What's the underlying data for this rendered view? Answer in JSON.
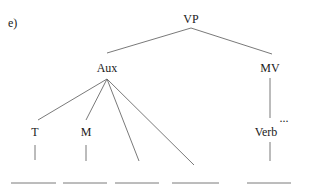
{
  "diagram": {
    "type": "syntax-tree",
    "label": "e)",
    "nodes": [
      {
        "id": "VP",
        "text": "VP",
        "x": 191,
        "y": 23
      },
      {
        "id": "Aux",
        "text": "Aux",
        "x": 107,
        "y": 72
      },
      {
        "id": "MV",
        "text": "MV",
        "x": 270,
        "y": 72
      },
      {
        "id": "T",
        "text": "T",
        "x": 35,
        "y": 136
      },
      {
        "id": "M",
        "text": "M",
        "x": 86,
        "y": 136
      },
      {
        "id": "Verb",
        "text": "Verb",
        "x": 266,
        "y": 136
      }
    ],
    "ellipsis": {
      "text": "...",
      "x": 284,
      "y": 122
    },
    "edges": [
      {
        "from": "VP",
        "to": "Aux",
        "x1": 191,
        "y1": 28,
        "x2": 107,
        "y2": 53
      },
      {
        "from": "VP",
        "to": "MV",
        "x1": 191,
        "y1": 28,
        "x2": 272,
        "y2": 54
      },
      {
        "from": "Aux",
        "to": "T",
        "x1": 107,
        "y1": 79,
        "x2": 38,
        "y2": 120
      },
      {
        "from": "Aux",
        "to": "M",
        "x1": 107,
        "y1": 79,
        "x2": 86,
        "y2": 120
      },
      {
        "from": "Aux",
        "to": "blank-3",
        "x1": 107,
        "y1": 79,
        "x2": 139,
        "y2": 161
      },
      {
        "from": "Aux",
        "to": "blank-4",
        "x1": 107,
        "y1": 79,
        "x2": 194,
        "y2": 165
      },
      {
        "from": "MV",
        "to": "Verb",
        "x1": 270,
        "y1": 78,
        "x2": 270,
        "y2": 118
      },
      {
        "from": "T",
        "to": "blank-1",
        "x1": 35,
        "y1": 145,
        "x2": 35,
        "y2": 160
      },
      {
        "from": "M",
        "to": "blank-2",
        "x1": 86,
        "y1": 145,
        "x2": 86,
        "y2": 161
      },
      {
        "from": "Verb",
        "to": "blank-5",
        "x1": 270,
        "y1": 142,
        "x2": 270,
        "y2": 161
      }
    ],
    "blanks": [
      {
        "x1": 11,
        "x2": 56,
        "y": 183
      },
      {
        "x1": 63,
        "x2": 107,
        "y": 183
      },
      {
        "x1": 115,
        "x2": 159,
        "y": 183
      },
      {
        "x1": 172,
        "x2": 219,
        "y": 183
      },
      {
        "x1": 247,
        "x2": 291,
        "y": 183
      }
    ]
  }
}
